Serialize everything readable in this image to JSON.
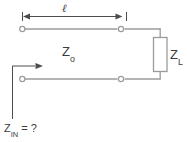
{
  "diagram": {
    "stroke_color": "#999999",
    "dimension_color": "#4d4d4d",
    "text_color": "#3b3b3b",
    "labels": {
      "length": "ℓ",
      "characteristic_impedance": "Z",
      "characteristic_impedance_sub": "o",
      "load_impedance": "Z",
      "load_impedance_sub": "L",
      "input_impedance": "Z",
      "input_impedance_sub": "IN",
      "input_impedance_value": " = ?"
    },
    "elements": {
      "dimension_line": "length-dimension-arrow",
      "top_conductor": "top-transmission-line",
      "bottom_conductor": "bottom-transmission-line",
      "load": "load-impedance-resistor",
      "input_arrow": "input-impedance-arrow",
      "terminals": "open-circle-terminals"
    }
  }
}
